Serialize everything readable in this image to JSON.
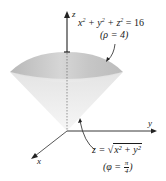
{
  "figure": {
    "axes": {
      "z_label": "z",
      "y_label": "y",
      "x_label": "x"
    },
    "sphere": {
      "equation_parts": {
        "x": "x",
        "y": "y",
        "z": "z",
        "exp": "2",
        "rhs": "= 16"
      },
      "spherical_form": "(ρ = 4)"
    },
    "cone": {
      "equation_lhs": "z =",
      "radicand": "x² + y²",
      "spherical_form_prefix": "(φ =",
      "fraction_num": "π",
      "fraction_den": "4",
      "spherical_form_suffix": ")"
    },
    "colors": {
      "cap_dark": "#bdbdbd",
      "cap_light": "#e2e2e2",
      "cone_fill": "#ececec",
      "axis": "#222222"
    }
  }
}
